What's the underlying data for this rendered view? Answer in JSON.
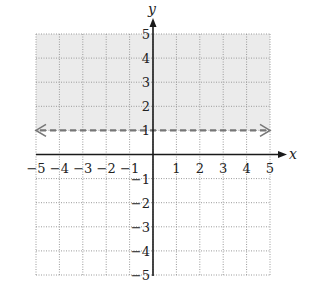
{
  "chart_data": {
    "type": "line",
    "title": "",
    "xlabel": "x",
    "ylabel": "y",
    "xlim": [
      -5,
      5
    ],
    "ylim": [
      -5,
      5
    ],
    "grid": true,
    "grid_style": "dotted",
    "x_ticks": [
      -5,
      -4,
      -3,
      -2,
      -1,
      1,
      2,
      3,
      4,
      5
    ],
    "y_ticks": [
      -5,
      -4,
      -3,
      -2,
      -1,
      1,
      2,
      3,
      4,
      5
    ],
    "x_tick_labels": [
      "−5",
      "−4",
      "−3",
      "−2",
      "−1",
      "1",
      "2",
      "3",
      "4",
      "5"
    ],
    "y_tick_labels": [
      "−5",
      "−4",
      "−3",
      "−2",
      "−1",
      "1",
      "2",
      "3",
      "4",
      "5"
    ],
    "series": [
      {
        "name": "y = 1",
        "x": [
          -5,
          5
        ],
        "y": [
          1,
          1
        ],
        "style": "dashed",
        "arrows": "both",
        "color": "#777777"
      }
    ],
    "shaded_region": {
      "inequality": "y > 1",
      "y_from": 1,
      "y_to": 5,
      "x_from": -5,
      "x_to": 5,
      "color": "#ebebeb"
    }
  },
  "colors": {
    "axis": "#1a1a1a",
    "grid": "#9a9a9a",
    "boundary": "#777777",
    "shade": "#ebebeb"
  }
}
